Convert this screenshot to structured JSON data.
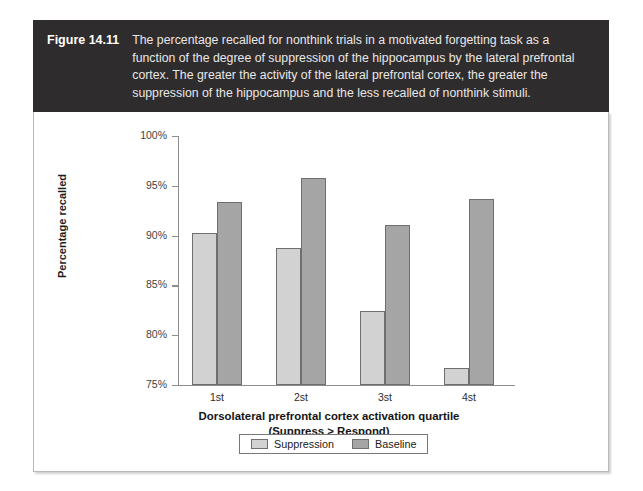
{
  "figure": {
    "label": "Figure 14.11",
    "caption": "The percentage recalled for nonthink trials in a motivated forgetting task as a function of the degree of suppression of the hippocampus by the lateral prefrontal cortex. The greater the activity of the lateral prefrontal cortex, the greater the suppression of the hippocampus and the less recalled of nonthink stimuli."
  },
  "colors": {
    "header_background": "#2e2c2d",
    "header_text": "#ffffff",
    "panel_background": "#ffffff",
    "suppression": "#d2d2d2",
    "baseline": "#a5a5a5",
    "axis": "#8d8d8d"
  },
  "chart_data": {
    "type": "bar",
    "title": "",
    "categories": [
      "1st",
      "2st",
      "3st",
      "4st"
    ],
    "series": [
      {
        "name": "Suppression",
        "color": "#d2d2d2",
        "values": [
          90.3,
          88.8,
          82.4,
          76.7
        ]
      },
      {
        "name": "Baseline",
        "color": "#a5a5a5",
        "values": [
          93.4,
          95.8,
          91.1,
          93.7
        ]
      }
    ],
    "xlabel": "Dorsolateral prefrontal cortex activation quartile",
    "xlabel_line2": "(Suppress > Respond)",
    "ylabel": "Percentage recalled",
    "ylim": [
      75,
      100
    ],
    "ytick_values": [
      75,
      80,
      85,
      90,
      95,
      100
    ],
    "ytick_labels": [
      "75%",
      "80%",
      "85%",
      "90%",
      "95%",
      "100%"
    ],
    "grid": false,
    "legend_position": "bottom"
  }
}
